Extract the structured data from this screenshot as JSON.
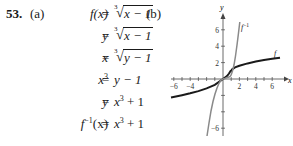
{
  "problem": {
    "number": "53.",
    "part_a_label": "(a)",
    "part_b_label": "(b)"
  },
  "equations": [
    {
      "lhs": "f(x)",
      "rhs_radicand": "x − 1",
      "radical_index": "3"
    },
    {
      "lhs": "y",
      "rhs_radicand": "x − 1",
      "radical_index": "3"
    },
    {
      "lhs": "x",
      "rhs_radicand": "y − 1",
      "radical_index": "3"
    },
    {
      "lhs_base": "x",
      "lhs_exp": "3",
      "rhs": "y − 1"
    },
    {
      "lhs": "y",
      "rhs_base": "x",
      "rhs_exp": "3",
      "rhs_tail": "+ 1"
    },
    {
      "lhs_base": "f",
      "lhs_exp": "−1",
      "lhs_arg": "(x)",
      "rhs_base": "x",
      "rhs_exp": "3",
      "rhs_tail": "+ 1"
    }
  ],
  "equals": "=",
  "graph": {
    "x_axis_label": "x",
    "y_axis_label": "y",
    "x_ticks": [
      "−6",
      "−4",
      "2",
      "4",
      "6"
    ],
    "y_ticks": [
      "6",
      "4",
      "2",
      "−6"
    ],
    "curve_labels": {
      "f": "f",
      "f_inverse": "f",
      "f_inverse_exp": "−1"
    },
    "colors": {
      "f": "#1a1a1a",
      "f_inverse": "#8a8a8a",
      "axes": "#444444"
    }
  }
}
